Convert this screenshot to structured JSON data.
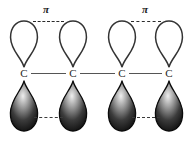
{
  "figure": {
    "background_color": "#ffffff"
  },
  "labels": {
    "pi_symbol": "π",
    "carbon_symbol": "C"
  },
  "pi_labels": [
    {
      "text": "π",
      "x": 46,
      "y": 4
    },
    {
      "text": "π",
      "x": 145,
      "y": 4
    }
  ],
  "atoms": [
    {
      "id": "c1",
      "label": "C",
      "x": 24,
      "y": 73
    },
    {
      "id": "c2",
      "label": "C",
      "x": 73,
      "y": 73
    },
    {
      "id": "c3",
      "label": "C",
      "x": 122,
      "y": 73
    },
    {
      "id": "c4",
      "label": "C",
      "x": 169,
      "y": 73
    }
  ],
  "sigma_bonds": [
    {
      "from": "c1",
      "to": "c2",
      "x": 31,
      "y": 73,
      "width": 35,
      "color": "#555555"
    },
    {
      "from": "c2",
      "to": "c3",
      "x": 80,
      "y": 73,
      "width": 35,
      "color": "#555555"
    },
    {
      "from": "c3",
      "to": "c4",
      "x": 129,
      "y": 73,
      "width": 33,
      "color": "#555555"
    }
  ],
  "top_lobes": [
    {
      "atom": "c1",
      "x": 24,
      "y": 20,
      "fill": "#ffffff",
      "stroke": "#333333"
    },
    {
      "atom": "c2",
      "x": 73,
      "y": 20,
      "fill": "#ffffff",
      "stroke": "#333333"
    },
    {
      "atom": "c3",
      "x": 122,
      "y": 20,
      "fill": "#ffffff",
      "stroke": "#333333"
    },
    {
      "atom": "c4",
      "x": 169,
      "y": 20,
      "fill": "#ffffff",
      "stroke": "#333333"
    }
  ],
  "bottom_lobes": [
    {
      "atom": "c1",
      "x": 24,
      "y": 80,
      "fill_light": "#e2e2e2",
      "fill_dark": "#0d0d0d"
    },
    {
      "atom": "c2",
      "x": 73,
      "y": 80,
      "fill_light": "#e2e2e2",
      "fill_dark": "#0d0d0d"
    },
    {
      "atom": "c3",
      "x": 122,
      "y": 80,
      "fill_light": "#e2e2e2",
      "fill_dark": "#0d0d0d"
    },
    {
      "atom": "c4",
      "x": 169,
      "y": 80,
      "fill_light": "#e2e2e2",
      "fill_dark": "#0d0d0d"
    }
  ],
  "pi_overlaps": [
    {
      "pair": "c1-c2",
      "position": "top",
      "x": 33,
      "y": 21,
      "width": 31,
      "color": "#2b2b2b"
    },
    {
      "pair": "c3-c4",
      "position": "top",
      "x": 131,
      "y": 21,
      "width": 30,
      "color": "#2b2b2b"
    },
    {
      "pair": "c1-c2",
      "position": "bottom",
      "x": 34,
      "y": 117,
      "width": 29,
      "color": "#3a3a3a"
    },
    {
      "pair": "c3-c4",
      "position": "bottom",
      "x": 132,
      "y": 117,
      "width": 28,
      "color": "#3a3a3a"
    }
  ]
}
